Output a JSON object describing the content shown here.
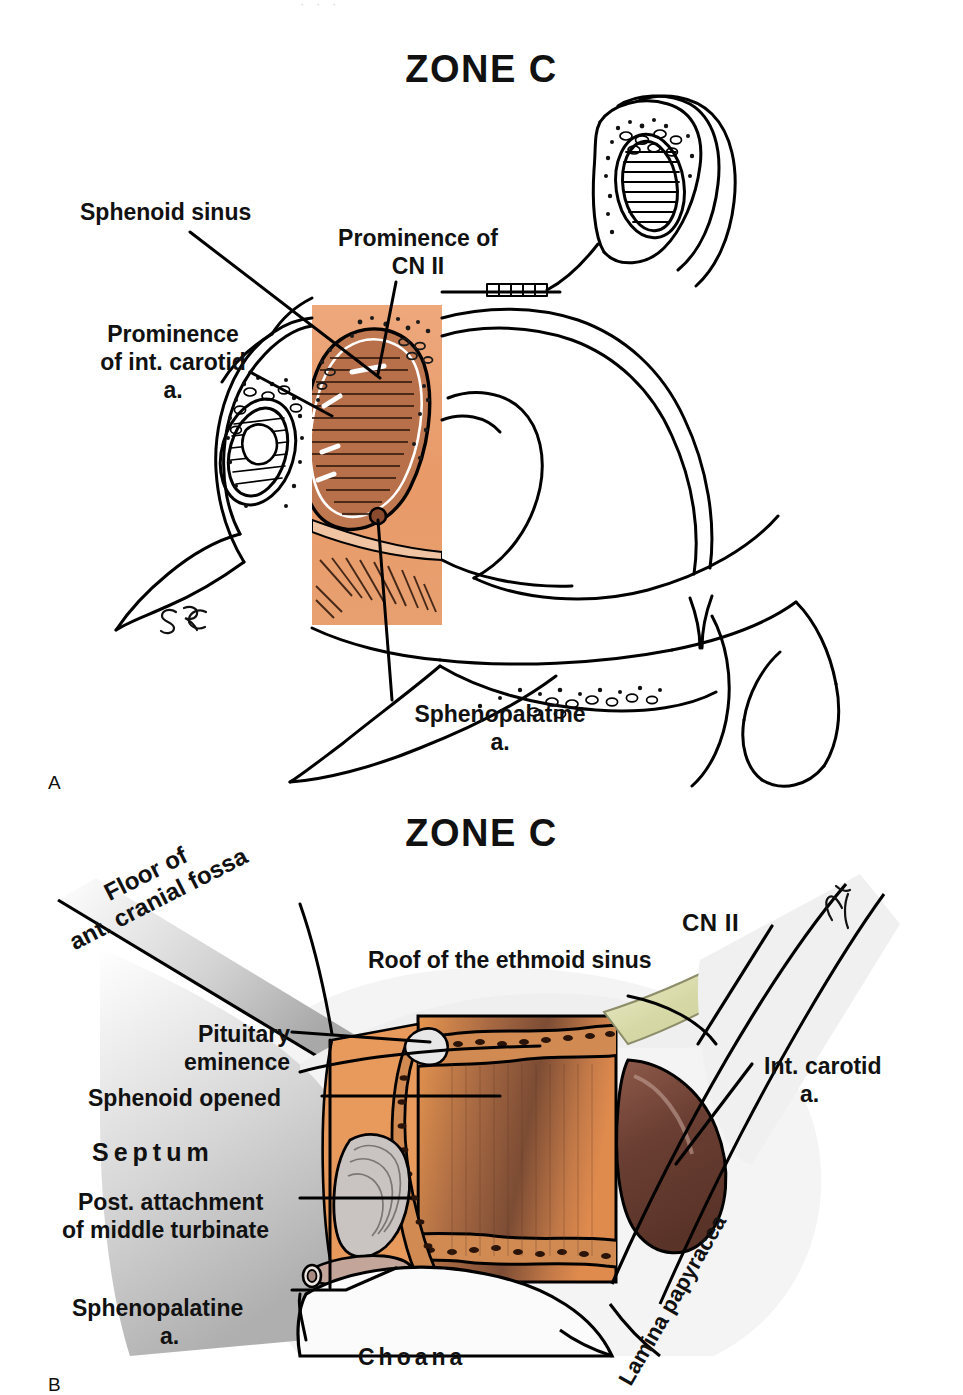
{
  "figure": {
    "kind": "medical-anatomical-illustration",
    "page_top_partial_text": "· · ·"
  },
  "colors": {
    "mucosa_orange": "#E89A68",
    "mucosa_orange_light": "#EFB188",
    "mucosa_orange_deep": "#D9793F",
    "muscle_brown": "#B4643F",
    "dark_brown": "#6E4231",
    "carotid_brown": "#7A4A3C",
    "nerve_pale": "#D8DCAE",
    "shadow_gray": "#BFBFBF",
    "line_black": "#000000",
    "paper_white": "#FFFFFF"
  },
  "panel_a": {
    "title": "ZONE C",
    "marker": "A",
    "signature": "SRC",
    "view": "sagittal section of the lateral nasal wall with the sphenoid sinus opened",
    "labels": [
      {
        "id": "sphenoid-sinus",
        "text": "Sphenoid sinus"
      },
      {
        "id": "prominence-cn2-l1",
        "text": "Prominence of"
      },
      {
        "id": "prominence-cn2-l2",
        "text": "CN II"
      },
      {
        "id": "prominence-carotid-l1",
        "text": "Prominence"
      },
      {
        "id": "prominence-carotid-l2",
        "text": "of int. carotid"
      },
      {
        "id": "prominence-carotid-l3",
        "text": "a."
      },
      {
        "id": "sphenopalatine-l1",
        "text": "Sphenopalatine"
      },
      {
        "id": "sphenopalatine-l2",
        "text": "a."
      }
    ]
  },
  "panel_b": {
    "title": "ZONE C",
    "marker": "B",
    "signature": "SRC",
    "view": "endoscopic view of the sphenoethmoid recess with the sphenoid opened",
    "labels": [
      {
        "id": "floor-ant-cranial-fossa-l1",
        "text": "Floor of"
      },
      {
        "id": "floor-ant-cranial-fossa-l2",
        "text": "ant. cranial fossa"
      },
      {
        "id": "roof-ethmoid-sinus",
        "text": "Roof of the ethmoid sinus"
      },
      {
        "id": "cn2",
        "text": "CN II"
      },
      {
        "id": "pituitary-eminence-l1",
        "text": "Pituitary"
      },
      {
        "id": "pituitary-eminence-l2",
        "text": "eminence"
      },
      {
        "id": "sphenoid-opened",
        "text": "Sphenoid opened"
      },
      {
        "id": "int-carotid-l1",
        "text": "Int. carotid"
      },
      {
        "id": "int-carotid-l2",
        "text": "a."
      },
      {
        "id": "septum",
        "text": "Septum"
      },
      {
        "id": "post-attach-turbinate-l1",
        "text": "Post. attachment"
      },
      {
        "id": "post-attach-turbinate-l2",
        "text": "of middle turbinate"
      },
      {
        "id": "sphenopalatine-l1",
        "text": "Sphenopalatine"
      },
      {
        "id": "sphenopalatine-l2",
        "text": "a."
      },
      {
        "id": "lamina-papyracea",
        "text": "Lamina papyracea"
      },
      {
        "id": "choana",
        "text": "Choana"
      }
    ]
  }
}
